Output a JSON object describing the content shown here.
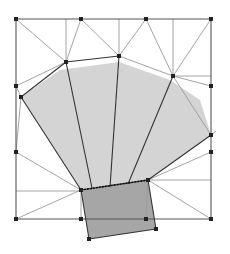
{
  "diagram": {
    "type": "triangulated-mesh-with-fan",
    "colors": {
      "background": "#ffffff",
      "fan_fill": "#d4d4d4",
      "base_fill": "#a6a6a6",
      "mesh_line": "#9a9a9a",
      "strong_line": "#333333",
      "frame_line": "#555555",
      "vertex": "#222222"
    },
    "frame": {
      "x1": 16,
      "y1": 19,
      "x2": 211,
      "y2": 219
    },
    "vertices": [
      [
        16,
        19
      ],
      [
        81,
        19
      ],
      [
        146,
        19
      ],
      [
        211,
        19
      ],
      [
        66,
        62
      ],
      [
        119,
        56
      ],
      [
        173,
        76
      ],
      [
        16,
        86
      ],
      [
        21,
        97
      ],
      [
        211,
        86
      ],
      [
        211,
        135
      ],
      [
        16,
        152
      ],
      [
        211,
        152
      ],
      [
        81,
        190
      ],
      [
        148,
        180
      ],
      [
        16,
        219
      ],
      [
        81,
        219
      ],
      [
        146,
        219
      ],
      [
        211,
        219
      ],
      [
        89,
        239
      ],
      [
        156,
        229
      ]
    ],
    "fan_polygon": [
      [
        21,
        97
      ],
      [
        60,
        70
      ],
      [
        119,
        62
      ],
      [
        170,
        80
      ],
      [
        200,
        100
      ],
      [
        211,
        135
      ],
      [
        148,
        180
      ],
      [
        81,
        190
      ]
    ],
    "base_polygon": [
      [
        81,
        190
      ],
      [
        148,
        180
      ],
      [
        156,
        229
      ],
      [
        89,
        239
      ]
    ],
    "strong_edges": [
      [
        [
          21,
          97
        ],
        [
          66,
          62
        ]
      ],
      [
        [
          66,
          62
        ],
        [
          119,
          56
        ]
      ],
      [
        [
          21,
          97
        ],
        [
          81,
          190
        ]
      ],
      [
        [
          66,
          62
        ],
        [
          92,
          188
        ]
      ],
      [
        [
          119,
          56
        ],
        [
          110,
          187
        ]
      ],
      [
        [
          173,
          76
        ],
        [
          128,
          184
        ]
      ],
      [
        [
          211,
          135
        ],
        [
          148,
          180
        ]
      ],
      [
        [
          81,
          190
        ],
        [
          148,
          180
        ]
      ],
      [
        [
          148,
          180
        ],
        [
          156,
          229
        ]
      ],
      [
        [
          156,
          229
        ],
        [
          89,
          239
        ]
      ],
      [
        [
          89,
          239
        ],
        [
          81,
          190
        ]
      ]
    ],
    "mesh_edges": [
      [
        [
          16,
          19
        ],
        [
          66,
          62
        ]
      ],
      [
        [
          66,
          19
        ],
        [
          66,
          62
        ]
      ],
      [
        [
          81,
          19
        ],
        [
          66,
          62
        ]
      ],
      [
        [
          81,
          19
        ],
        [
          119,
          56
        ]
      ],
      [
        [
          119,
          19
        ],
        [
          119,
          56
        ]
      ],
      [
        [
          146,
          19
        ],
        [
          119,
          56
        ]
      ],
      [
        [
          146,
          19
        ],
        [
          173,
          76
        ]
      ],
      [
        [
          173,
          19
        ],
        [
          173,
          76
        ]
      ],
      [
        [
          211,
          19
        ],
        [
          173,
          76
        ]
      ],
      [
        [
          119,
          56
        ],
        [
          173,
          76
        ]
      ],
      [
        [
          173,
          76
        ],
        [
          211,
          86
        ]
      ],
      [
        [
          173,
          76
        ],
        [
          211,
          76
        ]
      ],
      [
        [
          173,
          76
        ],
        [
          211,
          135
        ]
      ],
      [
        [
          66,
          62
        ],
        [
          16,
          86
        ]
      ],
      [
        [
          16,
          86
        ],
        [
          21,
          97
        ]
      ],
      [
        [
          21,
          97
        ],
        [
          16,
          152
        ]
      ],
      [
        [
          16,
          152
        ],
        [
          81,
          190
        ]
      ],
      [
        [
          16,
          191
        ],
        [
          81,
          191
        ]
      ],
      [
        [
          16,
          219
        ],
        [
          81,
          190
        ]
      ],
      [
        [
          81,
          190
        ],
        [
          81,
          219
        ]
      ],
      [
        [
          148,
          180
        ],
        [
          211,
          152
        ]
      ],
      [
        [
          148,
          180
        ],
        [
          211,
          180
        ]
      ],
      [
        [
          148,
          180
        ],
        [
          211,
          219
        ]
      ],
      [
        [
          211,
          135
        ],
        [
          216,
          131
        ]
      ],
      [
        [
          148,
          180
        ],
        [
          146,
          219
        ]
      ]
    ],
    "frame_edges": [
      [
        [
          16,
          19
        ],
        [
          211,
          19
        ]
      ],
      [
        [
          16,
          19
        ],
        [
          16,
          219
        ]
      ],
      [
        [
          211,
          19
        ],
        [
          211,
          219
        ]
      ],
      [
        [
          16,
          219
        ],
        [
          211,
          219
        ]
      ]
    ]
  }
}
